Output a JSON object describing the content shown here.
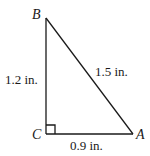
{
  "diagram": {
    "type": "right-triangle",
    "vertices": {
      "B": {
        "label": "B",
        "x": 46,
        "y": 18
      },
      "C": {
        "label": "C",
        "x": 46,
        "y": 134
      },
      "A": {
        "label": "A",
        "x": 133,
        "y": 134
      }
    },
    "sides": {
      "BC": {
        "label": "1.2 in."
      },
      "BA": {
        "label": "1.5 in."
      },
      "CA": {
        "label": "0.9 in."
      }
    },
    "right_angle_at": "C",
    "colors": {
      "stroke": "#1a1a1a",
      "background": "#ffffff"
    }
  }
}
